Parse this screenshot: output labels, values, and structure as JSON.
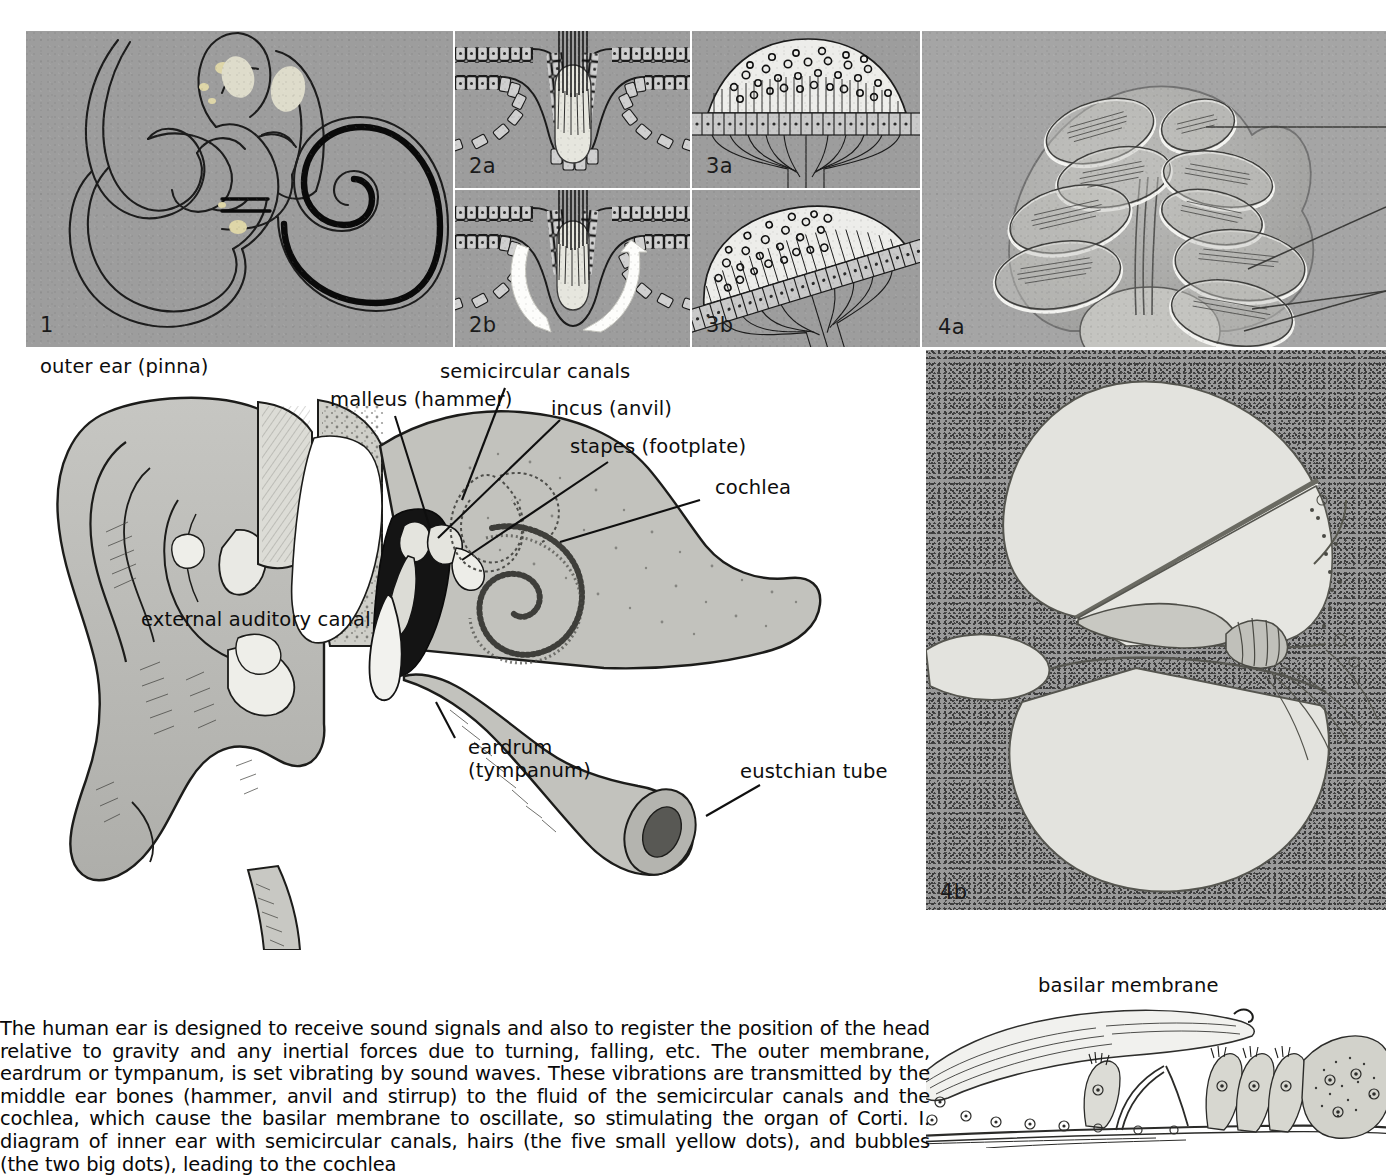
{
  "figure": {
    "panels": [
      {
        "id": "panel-1",
        "number": "1",
        "caption": "diagram of inner ear with semicircular canals"
      },
      {
        "id": "panel-2a",
        "number": "2a",
        "caption": "crista ampullaris at rest"
      },
      {
        "id": "panel-2b",
        "number": "2b",
        "caption": "crista ampullaris deflected by fluid flow"
      },
      {
        "id": "panel-3a",
        "number": "3a",
        "caption": "macula with otoliths, horizontal"
      },
      {
        "id": "panel-3b",
        "number": "3b",
        "caption": "macula with otoliths, tilted"
      },
      {
        "id": "panel-4a",
        "number": "4a",
        "caption": "section through the cochlear spiral"
      },
      {
        "id": "panel-4b",
        "number": "4b",
        "caption": "cross-section of one cochlear turn"
      }
    ],
    "main_labels": [
      {
        "key": "outer_ear",
        "text": "outer ear (pinna)"
      },
      {
        "key": "malleus",
        "text": "malleus (hammer)"
      },
      {
        "key": "semicircular",
        "text": "semicircular canals"
      },
      {
        "key": "incus",
        "text": "incus (anvil)"
      },
      {
        "key": "stapes",
        "text": "stapes (footplate)"
      },
      {
        "key": "cochlea",
        "text": "cochlea"
      },
      {
        "key": "eac",
        "text": "external auditory canal"
      },
      {
        "key": "eardrum",
        "text": "eardrum\n(tympanum)"
      },
      {
        "key": "eustachian",
        "text": "eustchian tube"
      },
      {
        "key": "basilar",
        "text": "basilar membrane"
      }
    ],
    "colors": {
      "panel_gray": "#9d9d9d",
      "panel_gray_light": "#a5a5a5",
      "stipple_gray": "#9a9a9a",
      "ink": "#0d0d0d",
      "page": "#ffffff",
      "tissue_fill": "#b8b8b8",
      "highlight": "#e9e9e4",
      "yellow_dot": "#ded6a8"
    }
  },
  "body": {
    "paragraph": "The human ear is designed to receive sound signals and also to register the position of the head relative to gravity and any inertial forces due to turning, falling, etc. The outer membrane, eardrum or tympanum, is set vibrating by sound waves. These vibrations are transmitted by the middle ear bones (hammer, anvil and stirrup) to the fluid of the semicircular canals and the cochlea, which cause the basilar membrane to oscillate, so stimulating the organ of Corti. I. diagram of inner ear with semicircular canals, hairs (the five small yellow dots), and bubbles (the two big dots), leading to the cochlea"
  }
}
